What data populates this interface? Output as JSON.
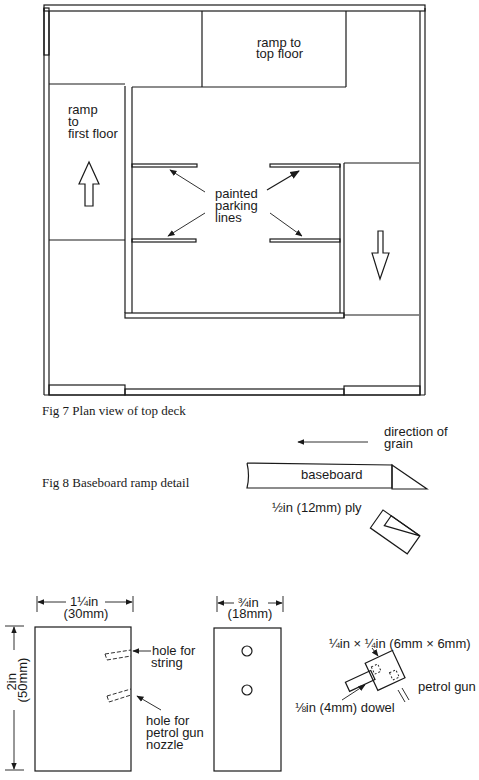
{
  "fig7": {
    "caption": "Fig 7 Plan view of top deck",
    "labels": {
      "ramp_top": [
        "ramp to",
        "top floor"
      ],
      "ramp_first": [
        "ramp",
        "to",
        "first floor"
      ],
      "parking": [
        "painted",
        "parking",
        "lines"
      ]
    }
  },
  "fig8": {
    "caption": "Fig 8 Baseboard ramp detail",
    "grain": [
      "direction of",
      "grain"
    ],
    "baseboard": "baseboard",
    "ply": "½in (12mm) ply"
  },
  "fig9": {
    "width_dim": [
      "1¼in",
      "(30mm)"
    ],
    "height_dim": [
      "2in",
      "(50mm)"
    ],
    "hole_string": [
      "hole for",
      "string"
    ],
    "hole_nozzle": [
      "hole for",
      "petrol gun",
      "nozzle"
    ],
    "side_dim": [
      "¾in",
      "(18mm)"
    ],
    "square_dim": "¼in × ¼in (6mm × 6mm)",
    "petrol_gun": "petrol gun",
    "dowel": "⅛in (4mm) dowel",
    "caption_partial": "Fig 9 Pe..."
  }
}
